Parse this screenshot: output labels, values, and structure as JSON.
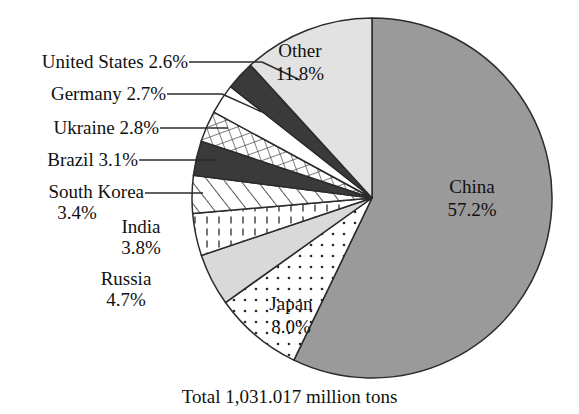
{
  "chart_data": {
    "type": "pie",
    "title": "",
    "total_caption": "Total  1,031.017 million tons",
    "legend_position": "callout-labels",
    "units": "percent",
    "categories": [
      "China",
      "Japan",
      "Russia",
      "India",
      "South Korea",
      "Brazil",
      "Ukraine",
      "Germany",
      "United States",
      "Other"
    ],
    "values": [
      57.2,
      8.0,
      4.7,
      3.8,
      3.4,
      3.1,
      2.8,
      2.7,
      2.6,
      11.8
    ],
    "slices": [
      {
        "name": "China",
        "value": 57.2,
        "display": "57.2%",
        "label_inside": true,
        "pattern": "solid-gray",
        "color": "#9a9a9a"
      },
      {
        "name": "Japan",
        "value": 8.0,
        "display": "8.0%",
        "label_inside": true,
        "pattern": "dots",
        "color": "#ffffff"
      },
      {
        "name": "Russia",
        "value": 4.7,
        "display": "4.7%",
        "label_inside": false,
        "pattern": "solid-lightgray",
        "color": "#d9d9d9"
      },
      {
        "name": "India",
        "value": 3.8,
        "display": "3.8%",
        "label_inside": false,
        "pattern": "vertical-dash",
        "color": "#ffffff"
      },
      {
        "name": "South Korea",
        "value": 3.4,
        "display": "3.4%",
        "label_inside": false,
        "pattern": "diagonal-stripe",
        "color": "#ffffff"
      },
      {
        "name": "Brazil",
        "value": 3.1,
        "display": "3.1%",
        "label_inside": false,
        "pattern": "solid-black",
        "color": "#3a3a3a"
      },
      {
        "name": "Ukraine",
        "value": 2.8,
        "display": "2.8%",
        "label_inside": false,
        "pattern": "grid",
        "color": "#ffffff"
      },
      {
        "name": "Germany",
        "value": 2.7,
        "display": "2.7%",
        "label_inside": false,
        "pattern": "blank",
        "color": "#ffffff"
      },
      {
        "name": "United States",
        "value": 2.6,
        "display": "2.6%",
        "label_inside": false,
        "pattern": "solid-black",
        "color": "#3a3a3a"
      },
      {
        "name": "Other",
        "value": 11.8,
        "display": "11.8%",
        "label_inside": true,
        "pattern": "solid-lightgray",
        "color": "#e2e2e2"
      }
    ]
  },
  "labels": {
    "united_states": {
      "line1": "United States 2.6%"
    },
    "germany": {
      "line1": "Germany 2.7%"
    },
    "ukraine": {
      "line1": "Ukraine 2.8%"
    },
    "brazil": {
      "line1": "Brazil 3.1%"
    },
    "south_korea": {
      "line1": "South Korea",
      "line2": "3.4%"
    },
    "india": {
      "line1": "India",
      "line2": "3.8%"
    },
    "russia": {
      "line1": "Russia",
      "line2": "4.7%"
    },
    "japan": {
      "line1": "Japan",
      "line2": "8.0%"
    },
    "other": {
      "line1": "Other",
      "line2": "11.8%"
    },
    "china": {
      "line1": "China",
      "line2": "57.2%"
    }
  },
  "caption": {
    "total": "Total  1,031.017 million tons"
  },
  "colors": {
    "outline": "#2b2b2b",
    "background": "#ffffff",
    "text": "#111111",
    "china_fill": "#9a9a9a",
    "other_fill": "#e2e2e2",
    "russia_fill": "#d9d9d9",
    "dark_fill": "#3a3a3a"
  }
}
